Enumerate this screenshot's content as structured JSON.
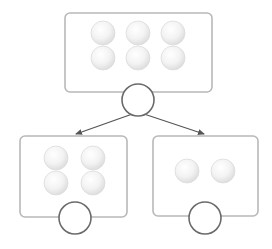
{
  "diagram": {
    "type": "tree-split",
    "colors": {
      "box_stroke": "#b8b8b8",
      "circle_stroke": "#6a6a6a",
      "arrow": "#555555",
      "ball_fill": "#f2f2f2",
      "ball_stroke": "#dcdcdc"
    },
    "nodes": [
      {
        "id": "root",
        "box": {
          "x": 65,
          "y": 13,
          "w": 147,
          "h": 79
        },
        "port": {
          "cx": 138,
          "cy": 100,
          "r": 16
        },
        "ball_count": 6,
        "balls": [
          {
            "cx": 103,
            "cy": 33
          },
          {
            "cx": 138,
            "cy": 33
          },
          {
            "cx": 173,
            "cy": 33
          },
          {
            "cx": 103,
            "cy": 58
          },
          {
            "cx": 138,
            "cy": 58
          },
          {
            "cx": 173,
            "cy": 58
          }
        ]
      },
      {
        "id": "left-child",
        "box": {
          "x": 20,
          "y": 136,
          "w": 107,
          "h": 81
        },
        "port": {
          "cx": 75,
          "cy": 218,
          "r": 16
        },
        "ball_count": 4,
        "balls": [
          {
            "cx": 56,
            "cy": 158
          },
          {
            "cx": 93,
            "cy": 158
          },
          {
            "cx": 56,
            "cy": 183
          },
          {
            "cx": 93,
            "cy": 183
          }
        ]
      },
      {
        "id": "right-child",
        "box": {
          "x": 153,
          "y": 136,
          "w": 105,
          "h": 80
        },
        "port": {
          "cx": 205,
          "cy": 218,
          "r": 16
        },
        "ball_count": 2,
        "balls": [
          {
            "cx": 187,
            "cy": 171
          },
          {
            "cx": 223,
            "cy": 171
          }
        ]
      }
    ],
    "edges": [
      {
        "from": "root",
        "to": "left-child",
        "x1": 138,
        "y1": 112,
        "x2": 76,
        "y2": 134
      },
      {
        "from": "root",
        "to": "right-child",
        "x1": 138,
        "y1": 112,
        "x2": 204,
        "y2": 134
      }
    ]
  }
}
